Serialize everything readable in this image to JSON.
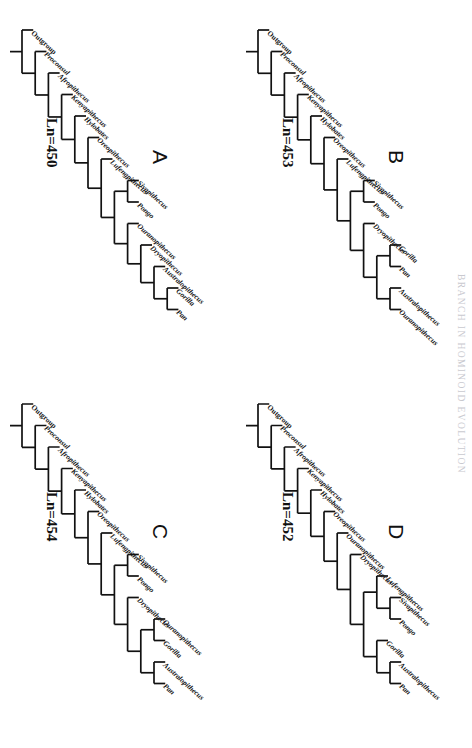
{
  "running_head": "BRANCH IN HOMINOID EVOLUTION",
  "figure": {
    "orientation_note": "rotated",
    "panels": [
      {
        "id": "A",
        "letter": "A",
        "score_label": "Ln=450",
        "taxa": [
          {
            "name": "Outgroup",
            "italic": false
          },
          {
            "name": "Proconsul",
            "italic": true
          },
          {
            "name": "Afropithecus",
            "italic": true
          },
          {
            "name": "Kenyapithecus",
            "italic": true
          },
          {
            "name": "Hylobates",
            "italic": true
          },
          {
            "name": "Oreopithecus",
            "italic": true
          },
          {
            "name": "Lufengpithecus",
            "italic": true
          },
          {
            "name": "Sivapithecus",
            "italic": true
          },
          {
            "name": "Pongo",
            "italic": true
          },
          {
            "name": "Ouranopithecus",
            "italic": true
          },
          {
            "name": "Dryopithecus",
            "italic": true
          },
          {
            "name": "Australopithecus",
            "italic": true
          },
          {
            "name": "Gorilla",
            "italic": true
          },
          {
            "name": "Pan",
            "italic": true
          }
        ],
        "newick": "(Outgroup,(Proconsul,(Afropithecus,(Kenyapithecus,(Hylobates,(Oreopithecus,(Lufengpithecus,((Sivapithecus,Pongo),(Ouranopithecus,(Dryopithecus,(Australopithecus,(Gorilla,Pan))))))))))));"
      },
      {
        "id": "B",
        "letter": "B",
        "score_label": "Ln=453",
        "taxa": [
          {
            "name": "Outgroup",
            "italic": false
          },
          {
            "name": "Proconsul",
            "italic": true
          },
          {
            "name": "Afropithecus",
            "italic": true
          },
          {
            "name": "Kenyapithecus",
            "italic": true
          },
          {
            "name": "Hylobates",
            "italic": true
          },
          {
            "name": "Oreopithecus",
            "italic": true
          },
          {
            "name": "Lufengpithecus",
            "italic": true
          },
          {
            "name": "Sivapithecus",
            "italic": true
          },
          {
            "name": "Pongo",
            "italic": true
          },
          {
            "name": "Dryopithecus",
            "italic": true
          },
          {
            "name": "Gorilla",
            "italic": true
          },
          {
            "name": "Pan",
            "italic": true
          },
          {
            "name": "Australopithecus",
            "italic": true
          },
          {
            "name": "Ouranopithecus",
            "italic": true
          }
        ],
        "newick": "(Outgroup,(Proconsul,(Afropithecus,(Kenyapithecus,(Hylobates,(Oreopithecus,(Lufengpithecus,((Sivapithecus,Pongo),(Dryopithecus,((Gorilla,Pan),(Australopithecus,Ouranopithecus)))))))))));"
      },
      {
        "id": "C",
        "letter": "C",
        "score_label": "Ln=454",
        "taxa": [
          {
            "name": "Outgroup",
            "italic": false
          },
          {
            "name": "Proconsul",
            "italic": true
          },
          {
            "name": "Afropithecus",
            "italic": true
          },
          {
            "name": "Kenyapithecus",
            "italic": true
          },
          {
            "name": "Hylobates",
            "italic": true
          },
          {
            "name": "Oreopithecus",
            "italic": true
          },
          {
            "name": "Lufengpithecus",
            "italic": true
          },
          {
            "name": "Sivapithecus",
            "italic": true
          },
          {
            "name": "Pongo",
            "italic": true
          },
          {
            "name": "Dryopithecus",
            "italic": true
          },
          {
            "name": "Ouranopithecus",
            "italic": true
          },
          {
            "name": "Gorilla",
            "italic": true
          },
          {
            "name": "Australopithecus",
            "italic": true
          },
          {
            "name": "Pan",
            "italic": true
          }
        ],
        "newick": "(Outgroup,(Proconsul,(Afropithecus,(Kenyapithecus,(Hylobates,(Oreopithecus,(Lufengpithecus,((Sivapithecus,Pongo),(Dryopithecus,((Ouranopithecus,Gorilla),(Australopithecus,Pan)))))))))));"
      },
      {
        "id": "D",
        "letter": "D",
        "score_label": "Ln=452",
        "taxa": [
          {
            "name": "Outgroup",
            "italic": false
          },
          {
            "name": "Proconsul",
            "italic": true
          },
          {
            "name": "Afropithecus",
            "italic": true
          },
          {
            "name": "Kenyapithecus",
            "italic": true
          },
          {
            "name": "Hylobates",
            "italic": true
          },
          {
            "name": "Oreopithecus",
            "italic": true
          },
          {
            "name": "Ouranopithecus",
            "italic": true
          },
          {
            "name": "Dryopithecus",
            "italic": true
          },
          {
            "name": "Lufengpithecus",
            "italic": true
          },
          {
            "name": "Sivapithecus",
            "italic": true
          },
          {
            "name": "Pongo",
            "italic": true
          },
          {
            "name": "Gorilla",
            "italic": true
          },
          {
            "name": "Australopithecus",
            "italic": true
          },
          {
            "name": "Pan",
            "italic": true
          }
        ],
        "newick": "(Outgroup,(Proconsul,(Afropithecus,(Kenyapithecus,(Hylobates,(Oreopithecus,(Ouranopithecus,(Dryopithecus,((Lufengpithecus,(Sivapithecus,Pongo)),(Gorilla,(Australopithecus,Pan)))))))))));"
      }
    ]
  },
  "geometry": {
    "panel_w": 374,
    "panel_h": 236,
    "tip_start_x": 30,
    "tip_step_x": 21.5,
    "root_y": 214,
    "level_step_y": 13.2,
    "letter_positions": {
      "A": {
        "x": 150,
        "y": 64
      },
      "B": {
        "x": 150,
        "y": 64
      },
      "C": {
        "x": 150,
        "y": 64
      },
      "D": {
        "x": 150,
        "y": 64
      }
    },
    "score_positions": {
      "A": {
        "x": 118,
        "y": 176
      },
      "B": {
        "x": 118,
        "y": 176
      },
      "C": {
        "x": 118,
        "y": 176
      },
      "D": {
        "x": 118,
        "y": 176
      }
    }
  }
}
